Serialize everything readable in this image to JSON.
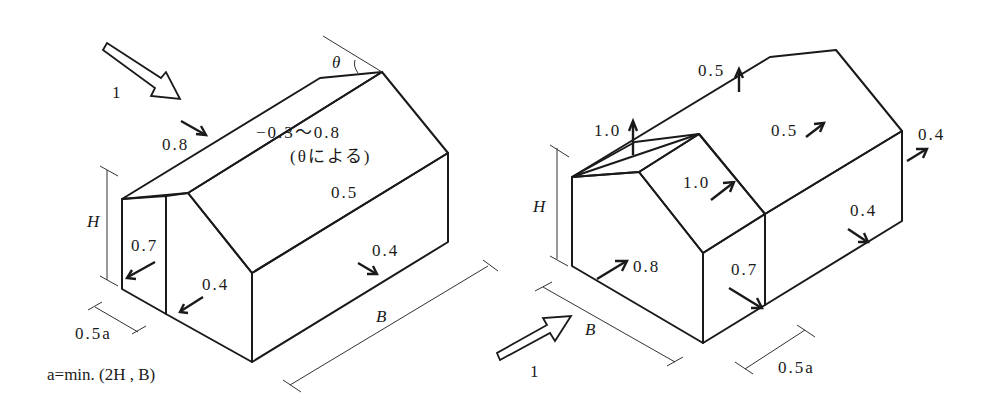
{
  "figure": {
    "formula": "a=min. (2H , B)"
  },
  "left_building": {
    "wind_label": "1",
    "theta_label": "θ",
    "windward_roof_label": "0.8",
    "leeward_roof_label": "−0.3〜0.8",
    "leeward_roof_note": "(θによる)",
    "roof_center_label": "0.5",
    "long_wall_label": "0.4",
    "gable_edge_label": "0.7",
    "gable_inner_label": "0.4",
    "height_label": "H",
    "edge_width_label": "0.5a",
    "length_label": "B"
  },
  "right_building": {
    "wind_label": "1",
    "roof_top_label": "0.5",
    "roof_edge_up_label": "1.0",
    "roof_edge_zone_label": "1.0",
    "roof_main_label": "0.5",
    "far_wall_label": "0.4",
    "side_wall_label": "0.4",
    "gable_windward_label": "0.8",
    "side_edge_label": "0.7",
    "height_label": "H",
    "width_label": "B",
    "edge_width_label": "0.5a"
  }
}
